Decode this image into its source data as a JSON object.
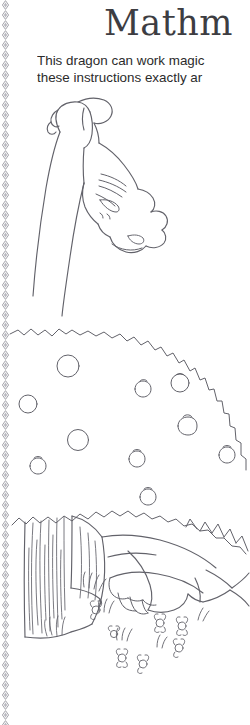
{
  "page": {
    "background_color": "#ffffff",
    "ink_color": "#5a5a60",
    "text_color": "#2b2b2b",
    "width": 250,
    "height": 725
  },
  "header": {
    "title": "Mathm",
    "title_note": "clipped at right edge of crop",
    "title_color": "#3d3d42"
  },
  "instructions": {
    "lines": [
      "This dragon can work magic",
      "these instructions exactly ar"
    ],
    "note": "both lines clipped at right edge of crop"
  },
  "decor": {
    "left_border": {
      "name": "chain-diamond-border",
      "color": "#8e8e96"
    }
  },
  "illustration": {
    "name": "sleeping-dragon-line-art",
    "parts": [
      {
        "name": "dragon-head",
        "label": "dragon head with closed eye"
      },
      {
        "name": "dragon-horns",
        "label": "frilled horns and ear"
      },
      {
        "name": "dragon-snout",
        "label": "snout with nostrils"
      },
      {
        "name": "dragon-neck",
        "label": "long curved neck"
      },
      {
        "name": "hill-mound",
        "label": "bushy hill ridge"
      },
      {
        "name": "pebble-cluster",
        "label": "scattered pebbles and buds"
      },
      {
        "name": "tree-trunk",
        "label": "bark textured tree trunk"
      },
      {
        "name": "dragon-body",
        "label": "reclining dragon body"
      },
      {
        "name": "dragon-back-spikes",
        "label": "triangular back spikes"
      },
      {
        "name": "dragon-claw",
        "label": "clawed forefoot"
      },
      {
        "name": "flower-cluster",
        "label": "daisy flowers and grass tufts"
      }
    ]
  }
}
